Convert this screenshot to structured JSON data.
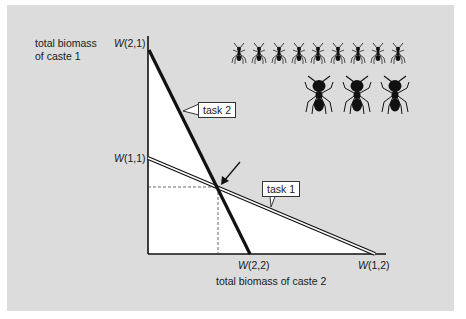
{
  "axes": {
    "y_label_line1": "total biomass",
    "y_label_line2": "of caste 1",
    "x_label": "total biomass of caste 2"
  },
  "ticks": {
    "w21": {
      "symbol": "W",
      "args": "(2,1)"
    },
    "w11": {
      "symbol": "W",
      "args": "(1,1)"
    },
    "w22": {
      "symbol": "W",
      "args": "(2,2)"
    },
    "w12": {
      "symbol": "W",
      "args": "(1,2)"
    }
  },
  "lines": {
    "task1": {
      "label": "task 1",
      "style": "double"
    },
    "task2": {
      "label": "task 2",
      "style": "thick"
    }
  },
  "annotation": {
    "arrow_target": "intersection of task 1 and task 2"
  },
  "pictograms": {
    "small_ants_count": 9,
    "large_ants_count": 3,
    "small_ants_meaning": "caste 1 (minor workers)",
    "large_ants_meaning": "caste 2 (major workers)"
  },
  "colors": {
    "panel": "#dcdcdc",
    "feasible_region": "#ffffff",
    "ink": "#111111"
  }
}
